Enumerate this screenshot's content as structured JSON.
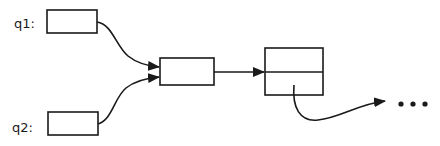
{
  "diagram": {
    "labels": {
      "q1": "q1:",
      "q2": "q2:"
    },
    "ellipsis": "• • •",
    "colors": {
      "stroke": "#1a1a1a",
      "background": "#ffffff"
    }
  }
}
